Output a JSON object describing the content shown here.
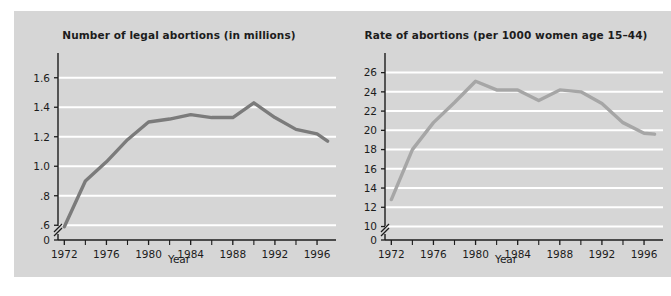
{
  "figure": {
    "background_color": "#ffffff",
    "panel_color": "#d6d6d6",
    "gridline_color": "#ffffff",
    "axis_color": "#1c1c1c",
    "text_color": "#1c1c1c"
  },
  "chart_data": [
    {
      "type": "line",
      "id": "number-of-legal-abortions",
      "title": "Number of legal abortions (in millions)",
      "xlabel": "Year",
      "ylabel": "",
      "series_color": "#7b7b7b",
      "grid": true,
      "legend": "none",
      "axis_break_y": true,
      "xlim": [
        1971.4,
        1997.8
      ],
      "ylim": [
        0.5,
        1.7
      ],
      "ytick_labels": [
        "1.6",
        "1.4",
        "1.2",
        "1.0",
        ".8",
        ".6",
        "0"
      ],
      "ytick_values": [
        1.6,
        1.4,
        1.2,
        1.0,
        0.8,
        0.6,
        0.5
      ],
      "ygrid_values": [
        0.6,
        0.8,
        1.0,
        1.2,
        1.4,
        1.6
      ],
      "xtick_labels": [
        "1972",
        "1976",
        "1980",
        "1984",
        "1988",
        "1992",
        "1996"
      ],
      "xtick_values": [
        1972,
        1976,
        1980,
        1984,
        1988,
        1992,
        1996
      ],
      "xminor_values": [
        1974,
        1978,
        1982,
        1986,
        1990,
        1994
      ],
      "x": [
        1972,
        1974,
        1976,
        1978,
        1980,
        1982,
        1984,
        1986,
        1988,
        1990,
        1992,
        1994,
        1996,
        1997
      ],
      "values": [
        0.59,
        0.9,
        1.03,
        1.18,
        1.3,
        1.32,
        1.35,
        1.33,
        1.33,
        1.43,
        1.33,
        1.25,
        1.22,
        1.17
      ]
    },
    {
      "type": "line",
      "id": "rate-of-abortions",
      "title": "Rate of abortions (per 1000 women age 15–44)",
      "xlabel": "Year",
      "ylabel": "",
      "series_color": "#a6a6a6",
      "grid": true,
      "legend": "none",
      "axis_break_y": true,
      "xlim": [
        1971.4,
        1997.8
      ],
      "ylim": [
        8.6,
        27.0
      ],
      "ytick_labels": [
        "26",
        "24",
        "22",
        "20",
        "18",
        "16",
        "14",
        "12",
        "10",
        "0"
      ],
      "ytick_values": [
        26,
        24,
        22,
        20,
        18,
        16,
        14,
        12,
        10,
        8.6
      ],
      "ygrid_values": [
        10,
        12,
        14,
        16,
        18,
        20,
        22,
        24,
        26
      ],
      "xtick_labels": [
        "1972",
        "1976",
        "1980",
        "1984",
        "1988",
        "1992",
        "1996"
      ],
      "xtick_values": [
        1972,
        1976,
        1980,
        1984,
        1988,
        1992,
        1996
      ],
      "xminor_values": [
        1974,
        1978,
        1982,
        1986,
        1990,
        1994
      ],
      "x": [
        1972,
        1974,
        1976,
        1978,
        1980,
        1982,
        1984,
        1986,
        1988,
        1990,
        1992,
        1994,
        1996,
        1997
      ],
      "values": [
        12.8,
        18.0,
        20.8,
        22.9,
        25.1,
        24.2,
        24.2,
        23.1,
        24.2,
        24.0,
        22.8,
        20.8,
        19.7,
        19.6
      ]
    }
  ]
}
